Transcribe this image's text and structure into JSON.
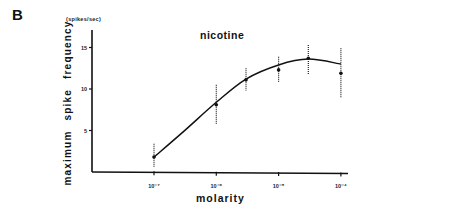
{
  "panel": {
    "label": "B"
  },
  "chart_data": {
    "type": "line",
    "title": "nicotine",
    "xlabel": "molarity",
    "ylabel": "maximum spike frequency",
    "yunit": "(spikes/sec)",
    "xscale": "log",
    "xticks": [
      "10⁻⁷",
      "10⁻⁶",
      "10⁻⁵",
      "10⁻⁴"
    ],
    "xtick_values": [
      1e-07,
      1e-06,
      1e-05,
      0.0001
    ],
    "yticks": [
      5,
      10,
      15
    ],
    "ylim": [
      0,
      17
    ],
    "grid": false,
    "legend": null,
    "series": [
      {
        "name": "nicotine (data points, mean ± error)",
        "x": [
          1e-07,
          1e-06,
          3e-06,
          1e-05,
          3e-05,
          0.0001
        ],
        "y": [
          1.8,
          8.1,
          11.1,
          12.3,
          13.7,
          11.9
        ],
        "err_low": [
          0.5,
          5.7,
          9.8,
          10.8,
          11.8,
          9.0
        ],
        "err_high": [
          3.4,
          10.5,
          12.5,
          13.9,
          15.3,
          14.9
        ]
      },
      {
        "name": "fitted curve",
        "x": [
          1e-07,
          3e-07,
          1e-06,
          3e-06,
          1e-05,
          3e-05,
          0.0001
        ],
        "y": [
          1.8,
          4.9,
          8.4,
          11.2,
          12.9,
          13.6,
          13.0
        ]
      }
    ]
  }
}
